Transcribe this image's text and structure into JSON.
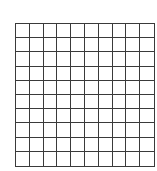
{
  "grid": {
    "rows": 10,
    "columns": 10,
    "line_color": "#3a3a3a",
    "cell_color": "#ffffff"
  }
}
